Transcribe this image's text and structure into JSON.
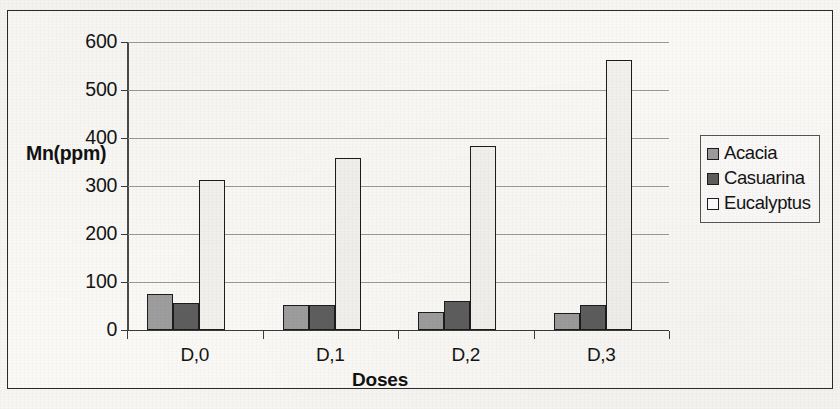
{
  "chart_data": {
    "type": "bar",
    "title": "",
    "subtitle": "",
    "xlabel": "Doses",
    "ylabel": "Mn(ppm)",
    "categories": [
      "D,0",
      "D,1",
      "D,2",
      "D,3"
    ],
    "series": [
      {
        "name": "Acacia",
        "values": [
          75,
          52,
          37,
          36
        ],
        "color": "#9d9d9d"
      },
      {
        "name": "Casuarina",
        "values": [
          57,
          52,
          61,
          52
        ],
        "color": "#5e5e5e"
      },
      {
        "name": "Eucalyptus",
        "values": [
          312,
          358,
          384,
          563
        ],
        "color": "#f2f1ee"
      }
    ],
    "ylim": [
      0,
      600
    ],
    "ytick_values": [
      600,
      500,
      400,
      300,
      200,
      100,
      0
    ],
    "ytick_labels": [
      "600",
      "500",
      "400",
      "300",
      "200",
      "100",
      "0"
    ],
    "grid": true,
    "grid_axis": "y",
    "legend_position": "right",
    "bar_border_color": "#1c1c1c",
    "axis_color": "#3a3a3a",
    "grid_color": "#9a9a9a",
    "background_color": "#faf9f6"
  },
  "legend": {
    "items": [
      {
        "label": "Acacia",
        "swatch": "#9d9d9d"
      },
      {
        "label": "Casuarina",
        "swatch": "#5e5e5e"
      },
      {
        "label": "Eucalyptus",
        "swatch": "#ffffff"
      }
    ]
  }
}
